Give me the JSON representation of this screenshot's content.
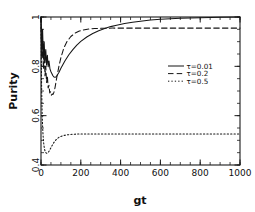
{
  "chart_data": {
    "type": "line",
    "title": "",
    "xlabel": "gt",
    "ylabel": "Purity",
    "xlim": [
      0,
      1000
    ],
    "ylim": [
      0.4,
      1.0
    ],
    "grid": false,
    "legend_position": "center-right",
    "xticks": [
      0,
      200,
      400,
      600,
      800,
      1000
    ],
    "xtick_labels": [
      "0",
      "200",
      "400",
      "600",
      "800",
      "1000"
    ],
    "yticks": [
      0.4,
      0.6,
      0.8,
      1.0
    ],
    "ytick_labels": [
      "0.4",
      "0.6",
      "0.8",
      "1"
    ],
    "xminor_step": 50,
    "yminor_step": 0.05,
    "series": [
      {
        "name": "tau=0.01",
        "legend_label": "τ=0.01",
        "style": "solid",
        "x": [
          0,
          4,
          8,
          12,
          16,
          20,
          24,
          28,
          32,
          36,
          40,
          45,
          50,
          55,
          60,
          65,
          70,
          75,
          80,
          90,
          100,
          120,
          140,
          160,
          180,
          200,
          230,
          260,
          290,
          320,
          350,
          380,
          420,
          460,
          500,
          550,
          600,
          650,
          700,
          750,
          800,
          900,
          1000
        ],
        "y": [
          1.0,
          0.845,
          0.95,
          0.83,
          0.9,
          0.815,
          0.868,
          0.805,
          0.845,
          0.798,
          0.822,
          0.79,
          0.778,
          0.77,
          0.762,
          0.757,
          0.756,
          0.757,
          0.762,
          0.775,
          0.792,
          0.822,
          0.847,
          0.868,
          0.886,
          0.901,
          0.919,
          0.933,
          0.944,
          0.953,
          0.961,
          0.967,
          0.974,
          0.979,
          0.983,
          0.988,
          0.991,
          0.993,
          0.995,
          0.996,
          0.997,
          0.999,
          1.0
        ]
      },
      {
        "name": "tau=0.2",
        "legend_label": "τ=0.2",
        "style": "dashed",
        "x": [
          0,
          4,
          8,
          12,
          16,
          20,
          24,
          28,
          32,
          36,
          40,
          44,
          48,
          52,
          56,
          60,
          65,
          70,
          75,
          80,
          90,
          100,
          115,
          130,
          150,
          170,
          190,
          210,
          240,
          270,
          300,
          330,
          360,
          400,
          450,
          500,
          600,
          700,
          800,
          900,
          1000
        ],
        "y": [
          1.0,
          0.83,
          0.9,
          0.79,
          0.85,
          0.762,
          0.8,
          0.735,
          0.762,
          0.712,
          0.723,
          0.692,
          0.697,
          0.683,
          0.688,
          0.686,
          0.695,
          0.712,
          0.735,
          0.758,
          0.8,
          0.835,
          0.875,
          0.9,
          0.921,
          0.934,
          0.942,
          0.947,
          0.951,
          0.953,
          0.954,
          0.9545,
          0.955,
          0.955,
          0.955,
          0.955,
          0.955,
          0.955,
          0.955,
          0.955,
          0.955
        ]
      },
      {
        "name": "tau=0.5",
        "legend_label": "τ=0.5",
        "style": "dotted",
        "x": [
          0,
          3,
          6,
          9,
          12,
          15,
          18,
          21,
          24,
          27,
          30,
          34,
          38,
          42,
          46,
          50,
          56,
          62,
          70,
          80,
          90,
          100,
          115,
          130,
          150,
          170,
          190,
          220,
          250,
          300,
          350,
          400,
          500,
          600,
          700,
          800,
          900,
          1000
        ],
        "y": [
          1.0,
          0.72,
          0.6,
          0.54,
          0.5,
          0.478,
          0.463,
          0.455,
          0.45,
          0.448,
          0.4475,
          0.449,
          0.453,
          0.458,
          0.464,
          0.47,
          0.479,
          0.488,
          0.497,
          0.506,
          0.512,
          0.516,
          0.52,
          0.522,
          0.524,
          0.525,
          0.5255,
          0.526,
          0.526,
          0.526,
          0.526,
          0.526,
          0.526,
          0.526,
          0.526,
          0.526,
          0.526,
          0.526
        ]
      }
    ]
  },
  "colors": {
    "axis": "#1a1a1a",
    "curve": "#151515",
    "background": "#ffffff"
  }
}
